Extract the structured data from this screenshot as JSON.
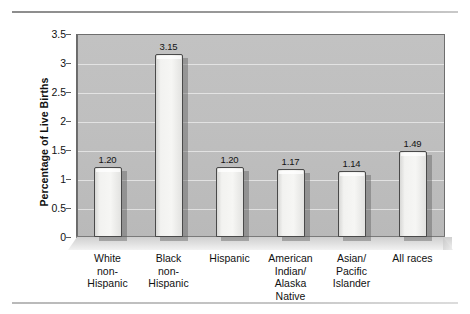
{
  "figure": {
    "top_rule": "horizontal-rule",
    "bottom_rule": "horizontal-rule"
  },
  "chart_data": {
    "type": "bar",
    "title": "",
    "xlabel": "",
    "ylabel": "Percentage of Live Births",
    "ylim": [
      0,
      3.5
    ],
    "ytick_labels": [
      "3.5",
      "3",
      "2.5",
      "2",
      "1.5",
      "1",
      "0.5",
      "0"
    ],
    "ytick_values": [
      3.5,
      3,
      2.5,
      2,
      1.5,
      1,
      0.5,
      0
    ],
    "grid": true,
    "grid_axis": "y",
    "legend": null,
    "categories": [
      "White non-Hispanic",
      "Black non-Hispanic",
      "Hispanic",
      "American Indian/ Alaska Native",
      "Asian/ Pacific Islander",
      "All races"
    ],
    "category_lines": [
      [
        "White",
        "non-",
        "Hispanic"
      ],
      [
        "Black",
        "non-",
        "Hispanic"
      ],
      [
        "Hispanic"
      ],
      [
        "American",
        "Indian/",
        "Alaska",
        "Native"
      ],
      [
        "Asian/",
        "Pacific",
        "Islander"
      ],
      [
        "All races"
      ]
    ],
    "values": [
      1.2,
      3.15,
      1.2,
      1.17,
      1.14,
      1.49
    ],
    "value_labels": [
      "1.20",
      "3.15",
      "1.20",
      "1.17",
      "1.14",
      "1.49"
    ],
    "colors": {
      "bar_face": "#f4f4f2",
      "bar_edge": "#4a4a4a",
      "plot_background": "#bfbfbf",
      "gridline": "#ffffff",
      "text": "#111111"
    }
  }
}
